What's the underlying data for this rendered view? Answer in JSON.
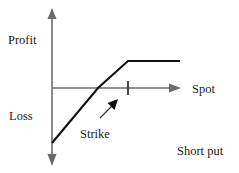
{
  "figure": {
    "title_caption": "Short put",
    "background_color": "#ffffff",
    "axis_color": "#6b6b6b",
    "payoff_color": "#111111",
    "labels": {
      "y_axis_positive": "Profit",
      "y_axis_negative": "Loss",
      "x_axis": "Spot",
      "strike_annotation": "Strike",
      "caption": "Short put"
    }
  },
  "chart_data": {
    "type": "line",
    "title": "Short put",
    "xlabel": "Spot",
    "ylabel": "Profit",
    "ylabel_negative": "Loss",
    "grid": false,
    "legend": "none",
    "axis_origin": [
      52,
      88
    ],
    "xlim": [
      52,
      180
    ],
    "ylim": [
      10,
      163
    ],
    "annotations": [
      {
        "text": "Strike",
        "points_to": "kink",
        "arrow_from": [
          100,
          118
        ],
        "arrow_to": [
          117,
          101
        ]
      },
      {
        "text": "Short put",
        "position": "bottom-right"
      }
    ],
    "ticks": [
      {
        "axis": "x",
        "label": "",
        "x": 128,
        "meaning": "strike"
      }
    ],
    "series": [
      {
        "name": "Short put payoff",
        "points": [
          [
            52,
            143
          ],
          [
            98,
            88
          ],
          [
            128,
            61
          ],
          [
            180,
            61
          ]
        ],
        "description": "Rises linearly from maximum loss at zero spot, crosses breakeven below strike, kinks at strike, then flat premium thereafter"
      }
    ]
  }
}
